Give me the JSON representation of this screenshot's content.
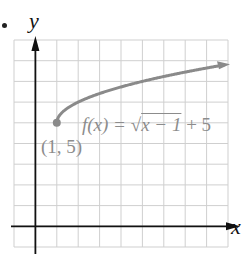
{
  "figure": {
    "bullet": "•",
    "x_axis_label": "x",
    "y_axis_label": "y",
    "function_label": {
      "prefix": "f(x) = ",
      "radicand": "x − 1",
      "suffix": " + 5"
    },
    "point_label": "(1, 5)"
  },
  "colors": {
    "grid": "#cfcfcf",
    "axes": "#111111",
    "curve": "#8a8a8a",
    "labels": "#8c8c8c"
  },
  "chart_data": {
    "type": "line",
    "xlabel": "x",
    "ylabel": "y",
    "xlim": [
      -1,
      9
    ],
    "ylim": [
      -1,
      9
    ],
    "grid": true,
    "tick_labels_shown": false,
    "series": [
      {
        "name": "f(x) = √(x − 1) + 5",
        "x": [
          1,
          1.25,
          1.5,
          2,
          3,
          4,
          5,
          6,
          7,
          8,
          9
        ],
        "y": [
          5,
          5.5,
          5.71,
          6,
          6.41,
          6.73,
          7,
          7.24,
          7.45,
          7.65,
          7.83
        ],
        "end_arrow": true
      }
    ],
    "annotations": [
      {
        "text": "(1, 5)",
        "x": 1,
        "y": 5,
        "marker": "filled-circle"
      }
    ]
  }
}
